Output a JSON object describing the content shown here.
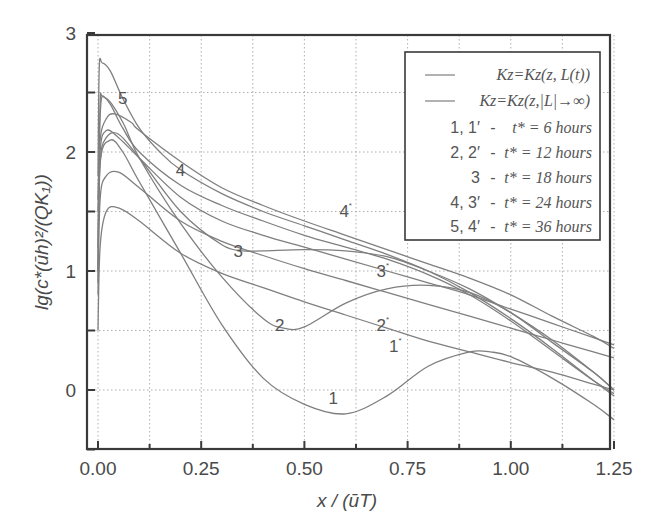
{
  "chart_data": {
    "type": "line",
    "title": "",
    "xlabel": "x / (ūT)",
    "ylabel": "lg(c*(ūh)²/(QK₁))",
    "xlim": [
      0.0,
      1.25
    ],
    "ylim": [
      -0.5,
      3.0
    ],
    "grid": true,
    "x_ticks": [
      "0.00",
      "0.25",
      "0.50",
      "0.75",
      "1.00",
      "1.25"
    ],
    "x_tick_values": [
      0.0,
      0.25,
      0.5,
      0.75,
      1.0,
      1.25
    ],
    "y_ticks": [
      "0",
      "1",
      "2",
      "3"
    ],
    "y_tick_values": [
      0,
      1,
      2,
      3
    ],
    "legend_position": "upper right",
    "legend": [
      {
        "style": "line",
        "text": "Kz=Kz(z, L(t))"
      },
      {
        "style": "line",
        "text": "Kz=Kz(z,|L|→∞)"
      },
      {
        "key": "1, 1*",
        "text": "t* = 6 hours"
      },
      {
        "key": "2, 2*",
        "text": "t* = 12 hours"
      },
      {
        "key": "3",
        "text": "t* = 18 hours"
      },
      {
        "key": "4, 3*",
        "text": "t* = 24 hours"
      },
      {
        "key": "5, 4*",
        "text": "t* = 36 hours"
      }
    ],
    "series": [
      {
        "name": "1",
        "label_at": [
          0.57,
          -0.12
        ],
        "x": [
          0.0,
          0.005,
          0.03,
          0.06,
          0.1,
          0.2,
          0.3,
          0.4,
          0.5,
          0.6,
          0.7,
          0.8,
          0.9,
          0.95,
          1.0,
          1.1,
          1.2,
          1.25
        ],
        "y": [
          0.9,
          1.9,
          2.1,
          2.0,
          1.75,
          1.15,
          0.55,
          0.1,
          -0.12,
          -0.2,
          -0.05,
          0.2,
          0.32,
          0.32,
          0.28,
          0.1,
          -0.12,
          -0.25
        ]
      },
      {
        "name": "1*",
        "label_at": [
          0.72,
          0.32
        ],
        "x": [
          0.0,
          0.005,
          0.02,
          0.05,
          0.1,
          0.2,
          0.3,
          0.4,
          0.5,
          0.6,
          0.7,
          0.8,
          0.9,
          1.0,
          1.1,
          1.2,
          1.25
        ],
        "y": [
          0.5,
          1.2,
          1.5,
          1.53,
          1.42,
          1.15,
          0.98,
          0.86,
          0.74,
          0.63,
          0.52,
          0.41,
          0.32,
          0.23,
          0.15,
          0.05,
          0.0
        ]
      },
      {
        "name": "2",
        "label_at": [
          0.44,
          0.5
        ],
        "x": [
          0.0,
          0.005,
          0.02,
          0.06,
          0.1,
          0.2,
          0.3,
          0.4,
          0.45,
          0.5,
          0.6,
          0.7,
          0.8,
          0.9,
          1.0,
          1.1,
          1.2,
          1.25
        ],
        "y": [
          1.0,
          2.3,
          2.45,
          2.25,
          1.95,
          1.4,
          0.95,
          0.6,
          0.52,
          0.53,
          0.73,
          0.85,
          0.88,
          0.82,
          0.65,
          0.4,
          0.15,
          0.0
        ]
      },
      {
        "name": "2*",
        "label_at": [
          0.69,
          0.5
        ],
        "x": [
          0.0,
          0.005,
          0.02,
          0.05,
          0.1,
          0.2,
          0.3,
          0.4,
          0.5,
          0.6,
          0.7,
          0.8,
          0.9,
          1.0,
          1.1,
          1.2,
          1.25
        ],
        "y": [
          0.8,
          1.6,
          1.8,
          1.83,
          1.7,
          1.42,
          1.25,
          1.13,
          1.02,
          0.92,
          0.82,
          0.72,
          0.62,
          0.52,
          0.42,
          0.32,
          0.27
        ]
      },
      {
        "name": "3",
        "label_at": [
          0.34,
          1.12
        ],
        "x": [
          0.0,
          0.005,
          0.02,
          0.05,
          0.1,
          0.2,
          0.3,
          0.35,
          0.4,
          0.5,
          0.6,
          0.7,
          0.8,
          0.9,
          1.0,
          1.1,
          1.2,
          1.25
        ],
        "y": [
          1.0,
          1.9,
          2.12,
          2.15,
          1.95,
          1.5,
          1.22,
          1.17,
          1.17,
          1.18,
          1.17,
          1.12,
          1.0,
          0.85,
          0.65,
          0.42,
          0.15,
          0.0
        ]
      },
      {
        "name": "3*",
        "label_at": [
          0.69,
          0.95
        ],
        "x": [
          0.0,
          0.005,
          0.02,
          0.05,
          0.1,
          0.2,
          0.3,
          0.4,
          0.5,
          0.6,
          0.7,
          0.8,
          0.9,
          1.0,
          1.1,
          1.2,
          1.25
        ],
        "y": [
          1.2,
          2.0,
          2.18,
          2.12,
          1.95,
          1.62,
          1.42,
          1.3,
          1.2,
          1.1,
          1.0,
          0.9,
          0.8,
          0.68,
          0.56,
          0.44,
          0.38
        ]
      },
      {
        "name": "4",
        "label_at": [
          0.2,
          1.8
        ],
        "x": [
          0.0,
          0.005,
          0.01,
          0.03,
          0.06,
          0.1,
          0.2,
          0.3,
          0.4,
          0.5,
          0.6,
          0.7,
          0.8,
          0.9,
          1.0,
          1.1,
          1.2,
          1.25
        ],
        "y": [
          1.5,
          2.4,
          2.47,
          2.4,
          2.2,
          2.0,
          1.72,
          1.55,
          1.42,
          1.3,
          1.2,
          1.1,
          0.97,
          0.8,
          0.58,
          0.33,
          0.08,
          -0.03
        ]
      },
      {
        "name": "4*",
        "label_at": [
          0.6,
          1.45
        ],
        "x": [
          0.0,
          0.005,
          0.02,
          0.04,
          0.08,
          0.1,
          0.2,
          0.3,
          0.4,
          0.5,
          0.6,
          0.7,
          0.8,
          0.9,
          1.0,
          1.1,
          1.2,
          1.25
        ],
        "y": [
          1.6,
          2.1,
          2.28,
          2.32,
          2.25,
          2.18,
          1.92,
          1.7,
          1.55,
          1.42,
          1.3,
          1.18,
          1.06,
          0.94,
          0.8,
          0.62,
          0.45,
          0.35
        ]
      },
      {
        "name": "5",
        "label_at": [
          0.06,
          2.4
        ],
        "x": [
          0.0,
          0.003,
          0.01,
          0.03,
          0.06,
          0.1,
          0.15,
          0.2,
          0.3,
          0.4,
          0.5,
          0.6,
          0.7,
          0.8,
          0.9,
          1.0,
          1.1,
          1.2,
          1.25
        ],
        "y": [
          1.8,
          2.7,
          2.75,
          2.68,
          2.45,
          2.2,
          2.0,
          1.85,
          1.65,
          1.5,
          1.38,
          1.26,
          1.14,
          1.0,
          0.82,
          0.6,
          0.35,
          0.08,
          -0.05
        ]
      }
    ]
  }
}
